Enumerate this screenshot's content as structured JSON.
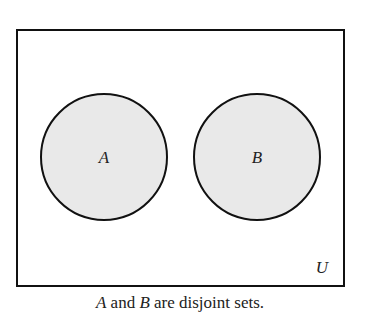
{
  "diagram": {
    "type": "venn",
    "universe": {
      "label": "U",
      "x": 17,
      "y": 30,
      "width": 327,
      "height": 256
    },
    "sets": [
      {
        "label": "A",
        "cx": 104,
        "cy": 157,
        "r": 63,
        "fill": "#e9e9e9"
      },
      {
        "label": "B",
        "cx": 257,
        "cy": 157,
        "r": 63,
        "fill": "#e9e9e9"
      }
    ],
    "stroke": "#111111",
    "caption": {
      "set_a": "A",
      "middle": " and ",
      "set_b": "B",
      "rest": " are disjoint sets."
    }
  }
}
